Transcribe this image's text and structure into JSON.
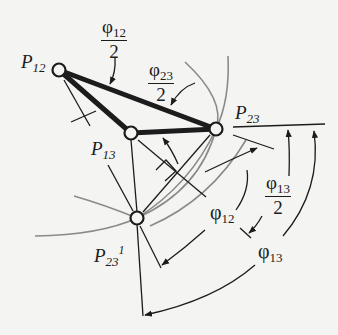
{
  "figure": {
    "type": "mechanism-pole-diagram",
    "colors": {
      "background": "#f4f4f2",
      "ink": "#1c1c1c",
      "arc_gray": "#8a8a8a"
    }
  },
  "poles": [
    {
      "id": "P12",
      "label_main": "P",
      "label_sub": "12",
      "label_sup": "",
      "x": 59,
      "y": 70
    },
    {
      "id": "P13",
      "label_main": "P",
      "label_sub": "13",
      "label_sup": "",
      "x": 131,
      "y": 133
    },
    {
      "id": "P23",
      "label_main": "P",
      "label_sub": "23",
      "label_sup": "",
      "x": 216,
      "y": 129
    },
    {
      "id": "P23prime",
      "label_main": "P",
      "label_sub": "23",
      "label_sup": "1",
      "x": 137,
      "y": 218
    }
  ],
  "angles": {
    "phi12_half": {
      "symbol": "φ",
      "sub": "12",
      "den": "2"
    },
    "phi23_half": {
      "symbol": "φ",
      "sub": "23",
      "den": "2"
    },
    "phi13_half": {
      "symbol": "φ",
      "sub": "13",
      "den": "2"
    },
    "phi12": {
      "symbol": "φ",
      "sub": "12"
    },
    "phi13": {
      "symbol": "φ",
      "sub": "13"
    }
  }
}
